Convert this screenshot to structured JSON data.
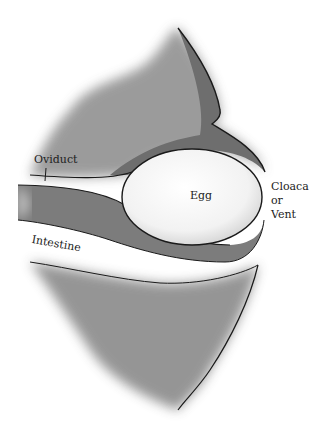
{
  "diagram": {
    "type": "anatomical illustration",
    "labels": {
      "oviduct": "Oviduct",
      "egg": "Egg",
      "cloaca_line1": "Cloaca",
      "cloaca_line2": "or",
      "cloaca_line3": "Vent",
      "intestine": "Intestine"
    },
    "colors": {
      "tissue": "#7a7a7a",
      "tissue_light": "#b5b5b5",
      "egg": "#f7f7f7",
      "outline": "#1a1a1a",
      "background": "#ffffff"
    }
  }
}
